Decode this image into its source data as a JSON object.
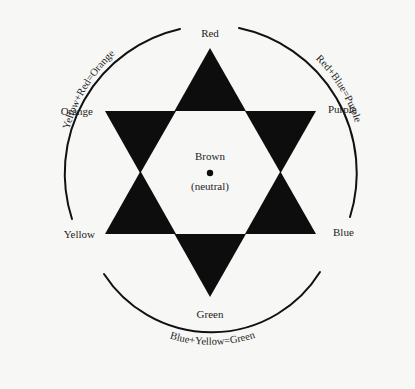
{
  "diagram": {
    "type": "color-star",
    "vertices": {
      "top": "Red",
      "upper_right": "Purple",
      "lower_right": "Blue",
      "bottom": "Green",
      "lower_left": "Yellow",
      "upper_left": "Orange"
    },
    "center": {
      "label": "Brown",
      "sublabel": "(neutral)"
    },
    "arcs": {
      "left": "Yellow+Red=Orange",
      "right": "Red+Blue=Purple",
      "bottom": "Blue+Yellow=Green"
    },
    "colors": {
      "star_fill": "#0d0d0d",
      "background": "#f7f7f5",
      "line": "#111111"
    }
  }
}
